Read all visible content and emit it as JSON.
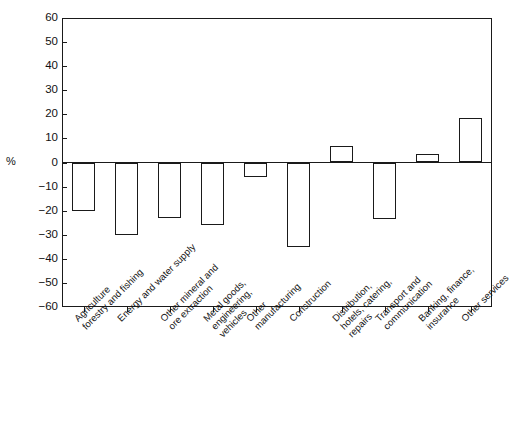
{
  "chart_data": {
    "type": "bar",
    "title": "",
    "subtitle": "",
    "xlabel": "",
    "ylabel": "%",
    "ylim": [
      -60,
      60
    ],
    "ytick_step": 10,
    "grid": false,
    "legend": null,
    "orientation": "vertical",
    "bar_style": "white-fill-black-outline",
    "yticks": [
      "60",
      "50",
      "40",
      "30",
      "20",
      "10",
      "0",
      "−10",
      "−20",
      "−30",
      "−40",
      "−50",
      "−60"
    ],
    "ytick_values": [
      60,
      50,
      40,
      30,
      20,
      10,
      0,
      -10,
      -20,
      -30,
      -40,
      -50,
      -60
    ],
    "categories": [
      "Agriculture\nforestry and fishing",
      "Energy and water supply",
      "Other mineral and\nore extraction",
      "Metal goods,\nengineering,\nvehicles",
      "Other\nmanufacturing",
      "Construction",
      "Distribution,\nhotels, catering,\nrepairs",
      "Transport and\ncommunication",
      "Banking, finance,\ninsurance",
      "Other services"
    ],
    "values": [
      -20,
      -30,
      -23,
      -26,
      -6,
      -35,
      7,
      -23.5,
      3.5,
      18.5
    ],
    "series": [
      {
        "name": "Percentage change",
        "values": [
          -20,
          -30,
          -23,
          -26,
          -6,
          -35,
          7,
          -23.5,
          3.5,
          18.5
        ]
      }
    ]
  },
  "figure": {
    "caption": ""
  },
  "colors": {
    "ink": "#1a1a1a",
    "bar_fill": "#ffffff",
    "background": "#ffffff"
  }
}
